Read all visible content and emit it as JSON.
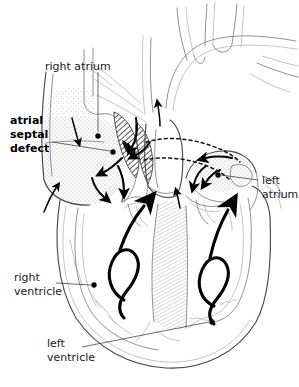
{
  "figure": {
    "background_color": "#ffffff",
    "line_color": "#4a4a4a",
    "accent_color": "#000000",
    "width": 299,
    "height": 387
  },
  "labels": {
    "right_atrium": "right atrium",
    "atrial_septal_defect_line1": "atrial",
    "atrial_septal_defect_line2": "septal",
    "atrial_septal_defect_line3": "defect",
    "left_atrium_line1": "left",
    "left_atrium_line2": "atrium",
    "right_ventricle_line1": "right",
    "right_ventricle_line2": "ventricle",
    "left_ventricle_line1": "left",
    "left_ventricle_line2": "ventricle"
  },
  "annotations": {
    "bold_label": "atrial septal defect",
    "callout_count": 5,
    "flow_arrow_count": 2,
    "shunt_arrow_count": 4
  }
}
